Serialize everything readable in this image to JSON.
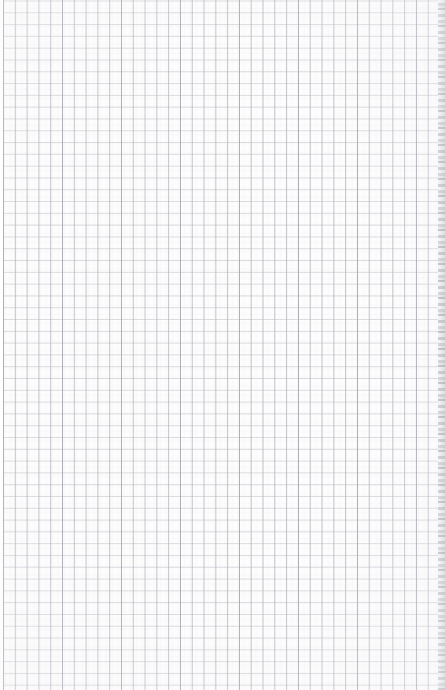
{
  "document": {
    "kind": "graph-paper-scan",
    "title": "Blank graph paper sheet",
    "text_content": "",
    "annotations": [],
    "visible_text": []
  },
  "page": {
    "width_px": 445,
    "height_px": 690,
    "background_color": "#fdfdfd"
  },
  "grid": {
    "cell_size_px": 11.8,
    "columns": 38,
    "rows": 59,
    "horizontal_line_color": "#c6c6cd",
    "vertical_line_color": "#acacb6",
    "accent_line_color": "#9696a2",
    "line_width_px": 1
  },
  "edges": {
    "left_margin": {
      "width_px": 3,
      "color": "#ffffff"
    },
    "right_edge": {
      "width_px": 7,
      "description": "torn paper edge",
      "color": "#a0a0a6"
    }
  }
}
